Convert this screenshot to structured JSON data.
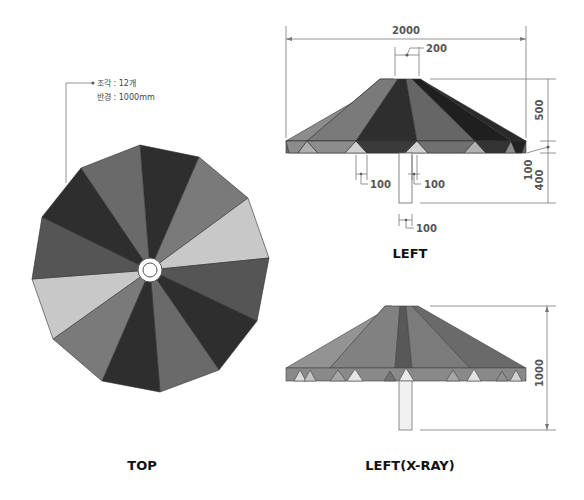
{
  "annotation": {
    "pieces_label": "조각 : 12개",
    "radius_label": "반경 : 1000mm"
  },
  "views": {
    "top": {
      "label": "TOP"
    },
    "left": {
      "label": "LEFT"
    },
    "left_xray": {
      "label": "LEFT(X-RAY)"
    }
  },
  "dimensions": {
    "overall_width": "2000",
    "top_cap_width": "200",
    "canopy_height": "500",
    "rim_height": "100",
    "pole_clearance": "400",
    "rim_tri_left": "100",
    "rim_tri_center": "100",
    "pole_width": "100",
    "total_height": "1000"
  },
  "colors": {
    "dark": "#2e2e2e",
    "mid_dark": "#555555",
    "mid": "#707070",
    "light": "#8c8c8c",
    "pale": "#c8c8c8",
    "ring": "#ffffff"
  }
}
